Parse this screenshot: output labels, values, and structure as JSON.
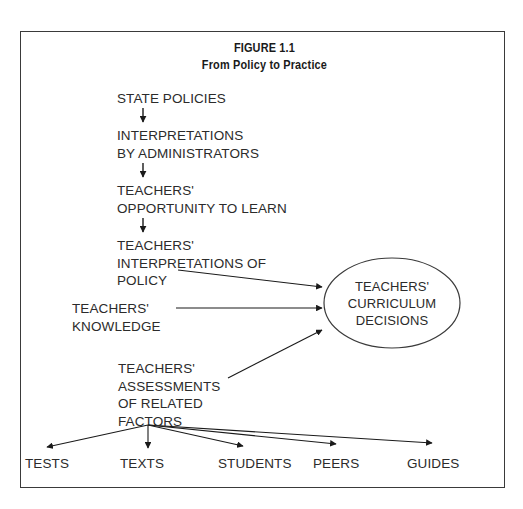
{
  "figure": {
    "title_line1": "FIGURE 1.1",
    "title_line2": "From Policy to Practice",
    "frame_color": "#3a3a3a",
    "text_color": "#2b2b2b",
    "background": "#ffffff"
  },
  "chain": [
    {
      "id": "state-policies",
      "text": "STATE POLICIES"
    },
    {
      "id": "interpretations-by-administrators",
      "text": "INTERPRETATIONS\nBY ADMINISTRATORS"
    },
    {
      "id": "teachers-opportunity-to-learn",
      "text": "TEACHERS'\nOPPORTUNITY TO LEARN"
    },
    {
      "id": "teachers-interpretations-of-policy",
      "text": "TEACHERS'\nINTERPRETATIONS OF\nPOLICY"
    }
  ],
  "inputs": [
    {
      "id": "teachers-knowledge",
      "text": "TEACHERS'\nKNOWLEDGE"
    },
    {
      "id": "teachers-assessments-of-related-factors",
      "text": "TEACHERS'\nASSESSMENTS\nOF RELATED\nFACTORS"
    }
  ],
  "outcome": {
    "id": "teachers-curriculum-decisions",
    "line1": "TEACHERS'",
    "line2": "CURRICULUM",
    "line3": "DECISIONS"
  },
  "factors": [
    {
      "id": "tests",
      "label": "TESTS"
    },
    {
      "id": "texts",
      "label": "TEXTS"
    },
    {
      "id": "students",
      "label": "STUDENTS"
    },
    {
      "id": "peers",
      "label": "PEERS"
    },
    {
      "id": "guides",
      "label": "GUIDES"
    }
  ]
}
